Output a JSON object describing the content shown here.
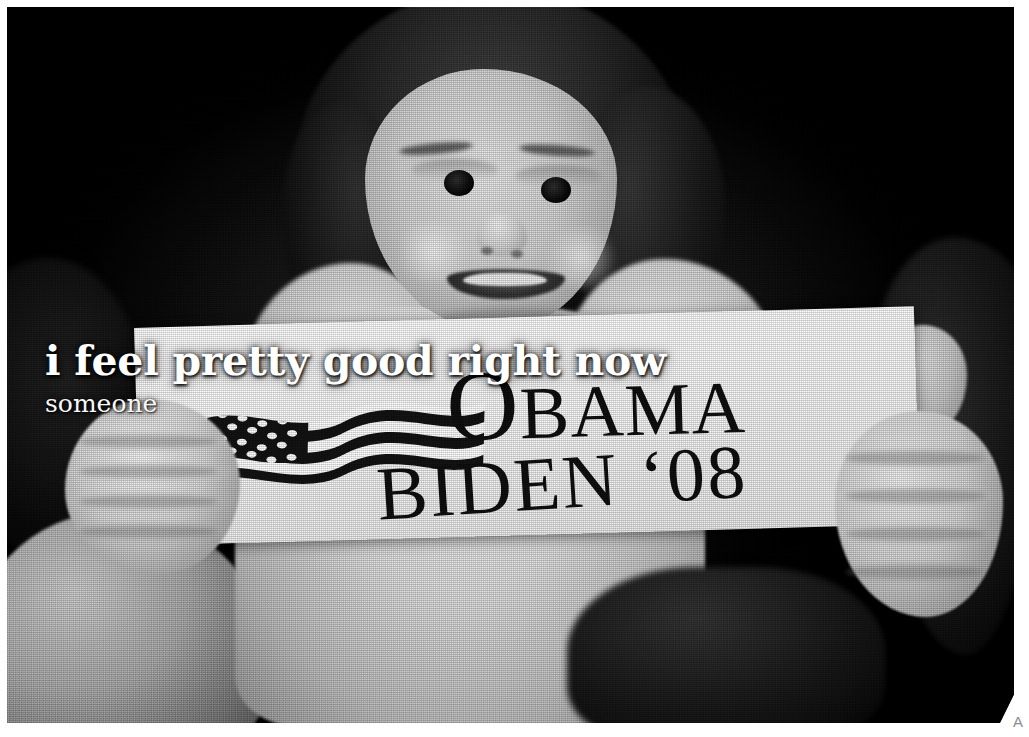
{
  "page": {
    "background_color": "#ffffff",
    "border_color": "#ffffff"
  },
  "photo": {
    "description": "Black and white halftone photograph of a smiling young child holding a political bumper sticker",
    "treatment": "grayscale-halftone",
    "corner_fold": true
  },
  "caption": {
    "headline": "i feel pretty good right now",
    "attribution": "someone",
    "text_color": "#ffffff"
  },
  "sticker": {
    "line1_first_letter": "O",
    "line1_rest": "BAMA",
    "line2": "BIDEN ‘08",
    "flag_icon": "usa-flag-icon",
    "background_color": "#f7f6f4",
    "text_color": "#181818"
  },
  "corner": {
    "mark": "A",
    "mark_color": "#8d8d8d"
  }
}
